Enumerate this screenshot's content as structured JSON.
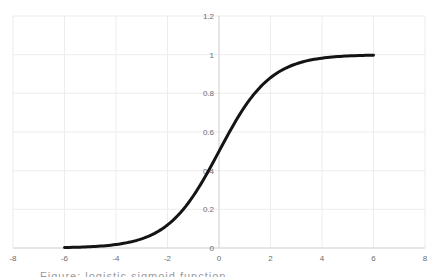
{
  "chart_data": {
    "type": "line",
    "title": "",
    "xlabel": "",
    "ylabel": "",
    "xlim": [
      -8,
      8
    ],
    "ylim": [
      0,
      1.2
    ],
    "x_ticks": [
      "-8",
      "-6",
      "-4",
      "-2",
      "0",
      "2",
      "4",
      "6",
      "8"
    ],
    "y_ticks": [
      "0",
      "0.2",
      "0.4",
      "0.6",
      "0.8",
      "1",
      "1.2"
    ],
    "grid": true,
    "legend": null,
    "series": [
      {
        "name": "sigmoid",
        "color": "#141414",
        "x": [
          -6,
          -5,
          -4,
          -3,
          -2,
          -1,
          0,
          1,
          2,
          3,
          4,
          5,
          6
        ],
        "y": [
          0.0025,
          0.0067,
          0.018,
          0.047,
          0.119,
          0.269,
          0.5,
          0.731,
          0.881,
          0.953,
          0.982,
          0.993,
          0.9975
        ]
      }
    ]
  },
  "caption": {
    "text": "Figure: logistic sigmoid function"
  }
}
